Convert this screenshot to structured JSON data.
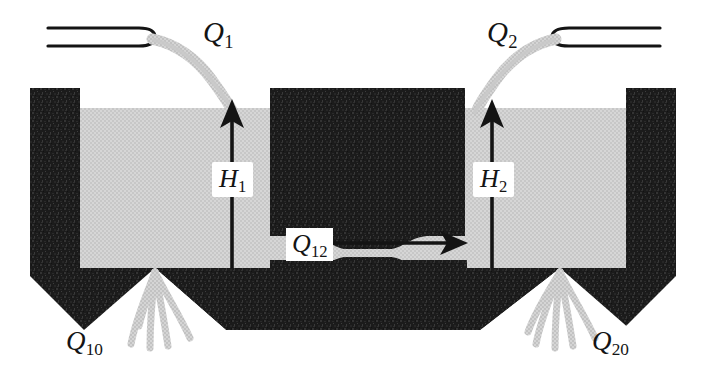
{
  "figure": {
    "type": "schematic-diagram",
    "background_color": "#ffffff",
    "wall_color": "#1c1c1c",
    "liquid_color": "#d2d2d2",
    "stream_color": "#cccccc",
    "ink_color": "#141414"
  },
  "labels": {
    "inflow_left": {
      "symbol": "Q",
      "sub": "1",
      "x": 203,
      "y": 18
    },
    "inflow_right": {
      "symbol": "Q",
      "sub": "2",
      "x": 487,
      "y": 18
    },
    "head_left": {
      "symbol": "H",
      "sub": "1",
      "x": 212,
      "y": 162
    },
    "head_right": {
      "symbol": "H",
      "sub": "2",
      "x": 473,
      "y": 162
    },
    "cross_flow": {
      "symbol": "Q",
      "sub": "12",
      "x": 286,
      "y": 228
    },
    "outflow_left": {
      "symbol": "Q",
      "sub": "10",
      "x": 66,
      "y": 328
    },
    "outflow_right": {
      "symbol": "Q",
      "sub": "20",
      "x": 592,
      "y": 328
    }
  },
  "elements": {
    "nozzle_left": {
      "name": "inlet-pipe-left",
      "x1": 48,
      "x2": 155,
      "y_top": 28,
      "y_bottom": 46
    },
    "nozzle_right": {
      "name": "inlet-pipe-right",
      "x1": 552,
      "x2": 660,
      "y_top": 28,
      "y_bottom": 46
    },
    "stream_left": {
      "name": "inlet-stream-left",
      "from_x": 155,
      "from_y": 37,
      "to_x": 232,
      "to_y": 110
    },
    "stream_right": {
      "name": "inlet-stream-right",
      "from_x": 552,
      "from_y": 37,
      "to_x": 477,
      "to_y": 110
    },
    "arrow_h1": {
      "name": "head-arrow-left",
      "x": 232,
      "y_tip": 100,
      "y_tail": 268
    },
    "arrow_h2": {
      "name": "head-arrow-right",
      "x": 492,
      "y_tip": 100,
      "y_tail": 268
    },
    "arrow_q12": {
      "name": "cross-flow-arrow",
      "x_tail": 300,
      "x_tip": 462,
      "y": 243
    },
    "liquid_surface_y": 108,
    "tank_floor_y": 268,
    "wall_left": {
      "x1": 30,
      "x2": 80,
      "y1": 88,
      "y2": 268
    },
    "wall_right": {
      "x1": 626,
      "x2": 676,
      "y1": 88,
      "y2": 268
    },
    "baffle_center": {
      "x1": 270,
      "x2": 465,
      "y1": 88,
      "y2": 236,
      "gap_y1": 236,
      "gap_y2": 258
    },
    "drain_notch_left_apex_x": 155,
    "drain_notch_right_apex_x": 560,
    "base_bottom_y": 330
  }
}
